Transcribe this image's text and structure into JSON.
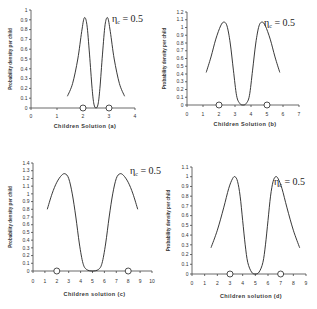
{
  "chart_data": [
    {
      "id": "a",
      "type": "line",
      "title": "",
      "xlabel": "Children Solution",
      "panel_label": "(a)",
      "ylabel": "Probability density per child",
      "annotation": "η_c = 0.5",
      "eta_symbol": "η",
      "eta_sub": "c",
      "eta_value": "= 0.5",
      "xlim": [
        0,
        4
      ],
      "ylim": [
        0,
        1
      ],
      "xticks": [
        0,
        1,
        2,
        3,
        4
      ],
      "yticks": [
        0,
        0.1,
        0.2,
        0.3,
        0.4,
        0.5,
        0.6,
        0.7,
        0.8,
        0.9,
        1
      ],
      "parents": [
        2,
        3
      ],
      "series": [
        {
          "name": "density",
          "x": [
            1.4,
            1.6,
            1.8,
            1.95,
            2.05,
            2.15,
            2.25,
            2.35,
            2.42,
            2.5,
            2.58,
            2.65,
            2.75,
            2.85,
            2.95,
            3.05,
            3.2,
            3.4,
            3.6
          ],
          "y": [
            0.12,
            0.25,
            0.5,
            0.78,
            0.92,
            0.85,
            0.55,
            0.2,
            0.04,
            0.0,
            0.04,
            0.2,
            0.55,
            0.85,
            0.92,
            0.78,
            0.5,
            0.25,
            0.12
          ]
        }
      ]
    },
    {
      "id": "b",
      "type": "line",
      "title": "",
      "xlabel": "Children Solution",
      "panel_label": "(b)",
      "ylabel": "Probability density per child",
      "annotation": "η_c = 0.5",
      "eta_symbol": "η",
      "eta_sub": "c",
      "eta_value": "= 0.5",
      "xlim": [
        0,
        7
      ],
      "ylim": [
        0,
        1.2
      ],
      "xticks": [
        0,
        1,
        2,
        3,
        4,
        5,
        6,
        7
      ],
      "yticks": [
        0,
        0.1,
        0.2,
        0.3,
        0.4,
        0.5,
        0.6,
        0.7,
        0.8,
        0.9,
        1,
        1.1,
        1.2
      ],
      "parents": [
        2,
        5
      ],
      "series": [
        {
          "name": "density",
          "x": [
            1.2,
            1.5,
            1.8,
            2.1,
            2.3,
            2.5,
            2.7,
            2.9,
            3.1,
            3.3,
            3.5,
            3.7,
            3.9,
            4.1,
            4.3,
            4.5,
            4.7,
            4.9,
            5.2,
            5.5,
            5.8
          ],
          "y": [
            0.42,
            0.62,
            0.85,
            1.02,
            1.07,
            1.02,
            0.8,
            0.45,
            0.12,
            0.02,
            0.0,
            0.02,
            0.12,
            0.45,
            0.8,
            1.02,
            1.07,
            1.02,
            0.85,
            0.62,
            0.42
          ]
        }
      ]
    },
    {
      "id": "c",
      "type": "line",
      "title": "",
      "xlabel": "Children solution",
      "panel_label": "(c)",
      "ylabel": "Probability density per child",
      "annotation": "η_c = 0.5",
      "eta_symbol": "η",
      "eta_sub": "c",
      "eta_value": "= 0.5",
      "xlim": [
        0,
        10
      ],
      "ylim": [
        0,
        1.4
      ],
      "xticks": [
        0,
        1,
        2,
        3,
        4,
        5,
        6,
        7,
        8,
        9,
        10
      ],
      "yticks": [
        0,
        0.1,
        0.2,
        0.3,
        0.4,
        0.5,
        0.6,
        0.7,
        0.8,
        0.9,
        1,
        1.1,
        1.2,
        1.3,
        1.4
      ],
      "parents": [
        2,
        8
      ],
      "series": [
        {
          "name": "density",
          "x": [
            1.2,
            1.6,
            2.0,
            2.4,
            2.7,
            3.0,
            3.3,
            3.6,
            3.9,
            4.2,
            4.5,
            5.0,
            5.5,
            5.8,
            6.1,
            6.4,
            6.7,
            7.0,
            7.3,
            7.6,
            8.0,
            8.4,
            8.8
          ],
          "y": [
            0.8,
            1.0,
            1.15,
            1.24,
            1.26,
            1.2,
            1.0,
            0.7,
            0.35,
            0.1,
            0.02,
            0.0,
            0.02,
            0.1,
            0.35,
            0.7,
            1.0,
            1.2,
            1.26,
            1.24,
            1.15,
            1.0,
            0.8
          ]
        }
      ]
    },
    {
      "id": "d",
      "type": "line",
      "title": "",
      "xlabel": "Children solution",
      "panel_label": "(d)",
      "ylabel": "Probability density per child",
      "annotation": "η_c = 0.5",
      "eta_symbol": "η",
      "eta_sub": "c",
      "eta_value": "= 0.5",
      "xlim": [
        0,
        9
      ],
      "ylim": [
        0,
        1.1
      ],
      "xticks": [
        0,
        1,
        2,
        3,
        4,
        5,
        6,
        7,
        8,
        9
      ],
      "yticks": [
        0,
        0.1,
        0.2,
        0.3,
        0.4,
        0.5,
        0.6,
        0.7,
        0.8,
        0.9,
        1,
        1.1
      ],
      "parents": [
        3,
        7
      ],
      "series": [
        {
          "name": "density",
          "x": [
            1.5,
            2.0,
            2.5,
            2.9,
            3.2,
            3.4,
            3.6,
            3.8,
            4.0,
            4.2,
            4.4,
            4.7,
            5.0,
            5.3,
            5.6,
            5.8,
            6.0,
            6.2,
            6.4,
            6.6,
            6.8,
            7.1,
            7.5,
            8.0,
            8.5
          ],
          "y": [
            0.27,
            0.45,
            0.68,
            0.88,
            0.98,
            1.0,
            0.95,
            0.8,
            0.55,
            0.3,
            0.12,
            0.02,
            0.0,
            0.02,
            0.12,
            0.3,
            0.55,
            0.8,
            0.95,
            1.0,
            0.98,
            0.88,
            0.68,
            0.45,
            0.27
          ]
        }
      ]
    }
  ],
  "layout": [
    {
      "x0": 31,
      "x1": 135,
      "y0": 108,
      "y1": 10,
      "xlabel_y": 128,
      "tick_y": 118,
      "ylabel_x": 12,
      "eta_x": 112,
      "eta_y": 22
    },
    {
      "x0": 187,
      "x1": 299,
      "y0": 105,
      "y1": 12,
      "xlabel_y": 126,
      "tick_y": 116,
      "ylabel_x": 166,
      "eta_x": 264,
      "eta_y": 26
    },
    {
      "x0": 33,
      "x1": 152,
      "y0": 271,
      "y1": 163,
      "xlabel_y": 296,
      "tick_y": 283,
      "ylabel_x": 12,
      "eta_x": 130,
      "eta_y": 174
    },
    {
      "x0": 192,
      "x1": 306,
      "y0": 274,
      "y1": 167,
      "xlabel_y": 298,
      "tick_y": 285,
      "ylabel_x": 170,
      "eta_x": 274,
      "eta_y": 185
    }
  ]
}
